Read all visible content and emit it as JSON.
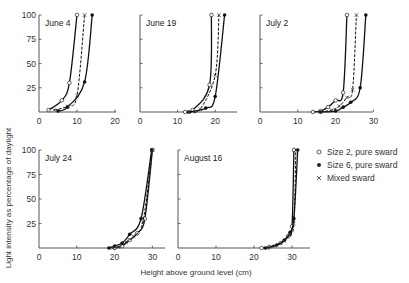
{
  "chart_data": {
    "type": "line",
    "xlabel": "Height above ground level  (cm)",
    "ylabel": "Light intensity as percentage of daylight",
    "legend": [
      {
        "marker": "open-circle",
        "label": "Size 2, pure sward"
      },
      {
        "marker": "filled-circle",
        "label": "Size 6, pure sward"
      },
      {
        "marker": "cross",
        "label": "Mixed sward"
      }
    ],
    "panels": [
      {
        "title": "June 4",
        "xlim": [
          0,
          20
        ],
        "xticks": [
          0,
          10,
          20
        ],
        "ylim": [
          0,
          100
        ],
        "yticks": [
          0,
          25,
          50,
          75,
          100
        ],
        "series": [
          {
            "name": "Size 2, pure sward",
            "x": [
              2.5,
              6,
              8,
              10
            ],
            "y": [
              2,
              12,
              30,
              100
            ]
          },
          {
            "name": "Size 6, pure sward",
            "x": [
              5,
              7.5,
              12,
              14
            ],
            "y": [
              1,
              5,
              31,
              100
            ]
          },
          {
            "name": "Mixed sward",
            "x": [
              4,
              7.5,
              10,
              12
            ],
            "y": [
              2,
              6,
              17,
              100
            ]
          }
        ]
      },
      {
        "title": "June 19",
        "xlim": [
          0,
          25
        ],
        "xticks": [
          0,
          10,
          20
        ],
        "ylim": [
          0,
          100
        ],
        "yticks": [
          0,
          25,
          50,
          75,
          100
        ],
        "series": [
          {
            "name": "Size 2, pure sward",
            "x": [
              12,
              14,
              18.5,
              19
            ],
            "y": [
              0,
              2,
              28,
              100
            ]
          },
          {
            "name": "Size 6, pure sward",
            "x": [
              13,
              17.5,
              20,
              22.5
            ],
            "y": [
              0,
              4,
              16,
              100
            ]
          },
          {
            "name": "Mixed sward",
            "x": [
              13,
              16,
              20,
              21
            ],
            "y": [
              0,
              3,
              38,
              100
            ]
          }
        ]
      },
      {
        "title": "July 2",
        "xlim": [
          0,
          30
        ],
        "xticks": [
          0,
          10,
          20,
          30
        ],
        "ylim": [
          0,
          100
        ],
        "yticks": [
          0,
          25,
          50,
          75,
          100
        ],
        "series": [
          {
            "name": "Size 2, pure sward",
            "x": [
              14,
              16,
              18,
              20,
              22,
              23
            ],
            "y": [
              0,
              1,
              5,
              12,
              20,
              100
            ]
          },
          {
            "name": "Size 6, pure sward",
            "x": [
              16,
              20,
              22,
              24,
              26.5,
              28
            ],
            "y": [
              0,
              1,
              5,
              10,
              25,
              100
            ]
          },
          {
            "name": "Mixed sward",
            "x": [
              16,
              19,
              21,
              23,
              24.5,
              25.5
            ],
            "y": [
              0,
              2,
              6,
              15,
              23,
              100
            ]
          }
        ]
      },
      {
        "title": "July 24",
        "xlim": [
          0,
          33
        ],
        "xticks": [
          0,
          10,
          20,
          30
        ],
        "ylim": [
          0,
          100
        ],
        "yticks": [
          0,
          25,
          50,
          75,
          100
        ],
        "series": [
          {
            "name": "Size 2, pure sward",
            "x": [
              20,
              22,
              24,
              26,
              28,
              30
            ],
            "y": [
              0,
              2,
              8,
              15,
              30,
              100
            ]
          },
          {
            "name": "Size 6, pure sward",
            "x": [
              18.5,
              20,
              22,
              24,
              27,
              29.8
            ],
            "y": [
              0,
              2,
              5,
              14,
              30,
              100
            ]
          },
          {
            "name": "Mixed sward",
            "x": [
              19.5,
              21,
              23,
              25,
              27.5,
              30
            ],
            "y": [
              0,
              1,
              6,
              12,
              27,
              100
            ]
          }
        ]
      },
      {
        "title": "August 16",
        "xlim": [
          0,
          35
        ],
        "xticks": [
          0,
          10,
          20,
          30
        ],
        "ylim": [
          0,
          100
        ],
        "yticks": [
          0,
          25,
          50,
          75,
          100
        ],
        "series": [
          {
            "name": "Size 2, pure sward",
            "x": [
              22,
              24,
              27,
              29,
              30,
              30.5
            ],
            "y": [
              0,
              1,
              5,
              12,
              22,
              100
            ]
          },
          {
            "name": "Size 6, pure sward",
            "x": [
              23,
              26,
              28,
              29.5,
              30.5,
              31.5
            ],
            "y": [
              0,
              3,
              8,
              16,
              30,
              100
            ]
          },
          {
            "name": "Mixed sward",
            "x": [
              23.5,
              25.5,
              28,
              29.5,
              30.5,
              31
            ],
            "y": [
              0,
              2,
              7,
              14,
              25,
              100
            ]
          }
        ]
      }
    ]
  },
  "layout_panels": [
    {
      "ox": 39,
      "oy": 112,
      "w": 77,
      "h": 97,
      "pxPerUnit": 3.8,
      "axisEnd": 116
    },
    {
      "ox": 140,
      "oy": 112,
      "w": 97,
      "h": 97,
      "pxPerUnit": 3.76,
      "axisEnd": 237
    },
    {
      "ox": 260,
      "oy": 112,
      "w": 113,
      "h": 97,
      "pxPerUnit": 3.78,
      "axisEnd": 373
    },
    {
      "ox": 39,
      "oy": 248,
      "w": 126,
      "h": 98,
      "pxPerUnit": 3.78,
      "axisEnd": 165
    },
    {
      "ox": 178,
      "oy": 248,
      "w": 132,
      "h": 98,
      "pxPerUnit": 3.8,
      "axisEnd": 310
    }
  ]
}
